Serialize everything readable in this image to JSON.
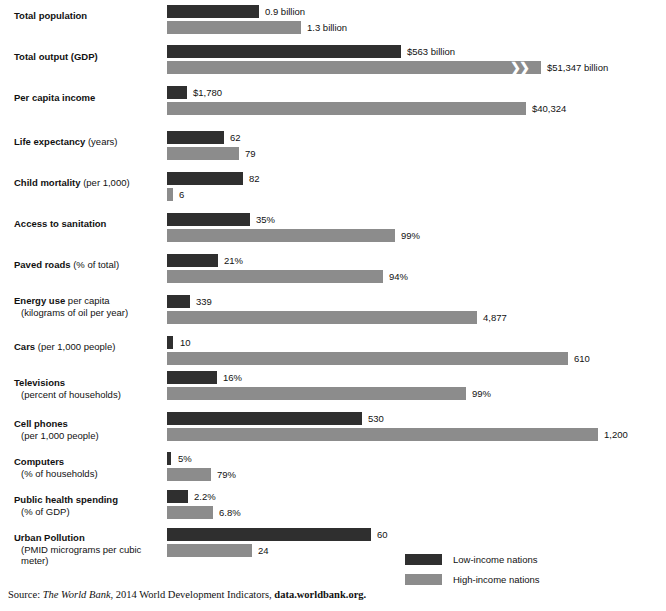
{
  "chart_data": {
    "type": "bar",
    "title": "",
    "subtitle": "",
    "xlabel": "",
    "ylabel": "",
    "orientation": "horizontal",
    "grid": false,
    "legend_position": "bottom-right",
    "series": [
      {
        "name": "Low-income nations",
        "color": "#2f2f2f"
      },
      {
        "name": "High-income nations",
        "color": "#8c8c8c"
      }
    ],
    "categories": [
      "Total population",
      "Total output (GDP)",
      "Per capita income",
      "Life expectancy (years)",
      "Child mortality (per 1,000)",
      "Access to sanitation",
      "Paved roads (% of total)",
      "Energy use per capita (kilograms of oil per year)",
      "Cars (per 1,000 people)",
      "Televisions (percent of households)",
      "Cell phones (per 1,000 people)",
      "Computers (% of households)",
      "Public health spending (% of GDP)",
      "Urban Pollution (PMID micrograms per cubic meter)"
    ],
    "rows": [
      {
        "label_bold": "Total population",
        "label_rest": "",
        "label_sub": "",
        "label_top": 10,
        "low": {
          "value_label": "0.9 billion",
          "value": 0.9,
          "top": 5,
          "width": 92,
          "label_x": 265
        },
        "high": {
          "value_label": "1.3 billion",
          "value": 1.3,
          "top": 21,
          "width": 134,
          "label_x": 307
        }
      },
      {
        "label_bold": "Total output (GDP)",
        "label_rest": "",
        "label_sub": "",
        "label_top": 51,
        "low": {
          "value_label": "$563 billion",
          "value": 563,
          "top": 45,
          "width": 234,
          "label_x": 407
        },
        "high": {
          "value_label": "$51,347 billion",
          "value": 51347,
          "top": 61,
          "width": 374,
          "label_x": 547,
          "break_x": 343
        }
      },
      {
        "label_bold": "Per capita income",
        "label_rest": "",
        "label_sub": "",
        "label_top": 92,
        "low": {
          "value_label": "$1,780",
          "value": 1780,
          "top": 86,
          "width": 20,
          "label_x": 193
        },
        "high": {
          "value_label": "$40,324",
          "value": 40324,
          "top": 102,
          "width": 359,
          "label_x": 532
        }
      },
      {
        "label_bold": "Life expectancy",
        "label_rest": " (years)",
        "label_sub": "",
        "label_top": 136,
        "low": {
          "value_label": "62",
          "value": 62,
          "top": 131,
          "width": 57,
          "label_x": 230
        },
        "high": {
          "value_label": "79",
          "value": 79,
          "top": 147,
          "width": 72,
          "label_x": 245
        }
      },
      {
        "label_bold": "Child mortality",
        "label_rest": " (per 1,000)",
        "label_sub": "",
        "label_top": 177,
        "low": {
          "value_label": "82",
          "value": 82,
          "top": 172,
          "width": 76,
          "label_x": 249
        },
        "high": {
          "value_label": "6",
          "value": 6,
          "top": 188,
          "width": 6,
          "label_x": 179
        }
      },
      {
        "label_bold": "Access to sanitation",
        "label_rest": "",
        "label_sub": "",
        "label_top": 218,
        "low": {
          "value_label": "35%",
          "value": 35,
          "top": 213,
          "width": 83,
          "label_x": 256
        },
        "high": {
          "value_label": "99%",
          "value": 99,
          "top": 229,
          "width": 228,
          "label_x": 401
        }
      },
      {
        "label_bold": "Paved roads",
        "label_rest": " (% of total)",
        "label_sub": "",
        "label_top": 259,
        "low": {
          "value_label": "21%",
          "value": 21,
          "top": 254,
          "width": 51,
          "label_x": 224
        },
        "high": {
          "value_label": "94%",
          "value": 94,
          "top": 270,
          "width": 216,
          "label_x": 389
        }
      },
      {
        "label_bold": "Energy use",
        "label_rest": " per capita",
        "label_sub": "(kilograms of oil per year)",
        "label_top": 295,
        "low": {
          "value_label": "339",
          "value": 339,
          "top": 295,
          "width": 23,
          "label_x": 196
        },
        "high": {
          "value_label": "4,877",
          "value": 4877,
          "top": 311,
          "width": 310,
          "label_x": 483
        }
      },
      {
        "label_bold": "Cars",
        "label_rest": " (per 1,000 people)",
        "label_sub": "",
        "label_top": 341,
        "low": {
          "value_label": "10",
          "value": 10,
          "top": 336,
          "width": 6,
          "label_x": 180
        },
        "high": {
          "value_label": "610",
          "value": 610,
          "top": 352,
          "width": 401,
          "label_x": 574
        }
      },
      {
        "label_bold": "Televisions",
        "label_rest": "",
        "label_sub": "(percent of households)",
        "label_top": 377,
        "low": {
          "value_label": "16%",
          "value": 16,
          "top": 371,
          "width": 50,
          "label_x": 223
        },
        "high": {
          "value_label": "99%",
          "value": 99,
          "top": 387,
          "width": 299,
          "label_x": 472
        }
      },
      {
        "label_bold": "Cell phones",
        "label_rest": "",
        "label_sub": "(per 1,000 people)",
        "label_top": 418,
        "low": {
          "value_label": "530",
          "value": 530,
          "top": 412,
          "width": 195,
          "label_x": 368
        },
        "high": {
          "value_label": "1,200",
          "value": 1200,
          "top": 428,
          "width": 431,
          "label_x": 604
        }
      },
      {
        "label_bold": "Computers",
        "label_rest": "",
        "label_sub": "(% of households)",
        "label_top": 456,
        "low": {
          "value_label": "5%",
          "value": 5,
          "top": 452,
          "width": 4,
          "label_x": 178
        },
        "high": {
          "value_label": "79%",
          "value": 79,
          "top": 468,
          "width": 44,
          "label_x": 217
        }
      },
      {
        "label_bold": "Public health spending",
        "label_rest": "",
        "label_sub": "(% of GDP)",
        "label_top": 494,
        "low": {
          "value_label": "2.2%",
          "value": 2.2,
          "top": 490,
          "width": 21,
          "label_x": 194
        },
        "high": {
          "value_label": "6.8%",
          "value": 6.8,
          "top": 506,
          "width": 46,
          "label_x": 219
        }
      },
      {
        "label_bold": "Urban Pollution",
        "label_rest": "",
        "label_sub": "(PMID micrograms per cubic meter)",
        "label_top": 532,
        "low": {
          "value_label": "60",
          "value": 60,
          "top": 528,
          "width": 204,
          "label_x": 377
        },
        "high": {
          "value_label": "24",
          "value": 24,
          "top": 544,
          "width": 85,
          "label_x": 258
        }
      }
    ],
    "bar_origin_x": 167,
    "break_symbol": "❯❯"
  },
  "legend": {
    "items": [
      {
        "label": "Low-income nations",
        "color": "#2f2f2f"
      },
      {
        "label": "High-income nations",
        "color": "#8c8c8c"
      }
    ]
  },
  "source": {
    "prefix": "Source: ",
    "italic": "The World Bank",
    "middle": ", 2014 World Development Indicators, ",
    "bold": "data.worldbank.org."
  }
}
